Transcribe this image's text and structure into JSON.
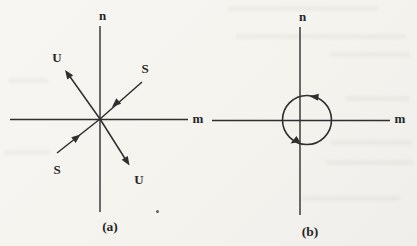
{
  "figure": {
    "kind": "phase-portrait-pair",
    "background_color": "#f6f5f1",
    "ink_color": "#2f2f2f",
    "panel_a": {
      "caption": "(a)",
      "portrait_type": "saddle point",
      "vertical_axis_label": "n",
      "horizontal_axis_label": "m",
      "upper_left_branch_label": "U",
      "upper_right_branch_label": "S",
      "lower_left_branch_label": "S",
      "lower_right_branch_label": "U"
    },
    "panel_b": {
      "caption": "(b)",
      "portrait_type": "limit cycle",
      "vertical_axis_label": "n",
      "horizontal_axis_label": "m"
    }
  }
}
